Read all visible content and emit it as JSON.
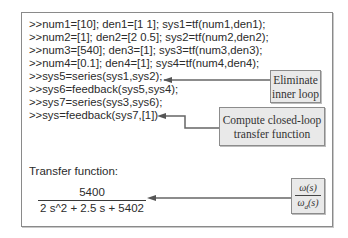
{
  "code_lines": [
    ">>num1=[10]; den1=[1 1]; sys1=tf(num1,den1);",
    ">>num2=[1]; den2=[2 0.5]; sys2=tf(num2,den2);",
    ">>num3=[540]; den3=[1]; sys3=tf(num3,den3);",
    ">>num4=[0.1]; den4=[1]; sys4=tf(num4,den4);",
    ">>sys5=series(sys1,sys2);",
    ">>sys6=feedback(sys5,sys4);",
    ">>sys7=series(sys3,sys6);",
    ">>sys=feedback(sys7,[1])"
  ],
  "callouts": {
    "eliminate": {
      "line1": "Eliminate",
      "line2": "inner loop"
    },
    "compute": {
      "line1": "Compute closed-loop",
      "line2": "transfer function"
    }
  },
  "output": {
    "label": "Transfer function:",
    "numerator": "5400",
    "denominator": "2 s^2 + 2.5 s + 5402"
  },
  "omega_box": {
    "numerator": "ω(s)",
    "denominator_symbol": "ω",
    "denominator_subscript": "d",
    "denominator_suffix": "(s)"
  }
}
